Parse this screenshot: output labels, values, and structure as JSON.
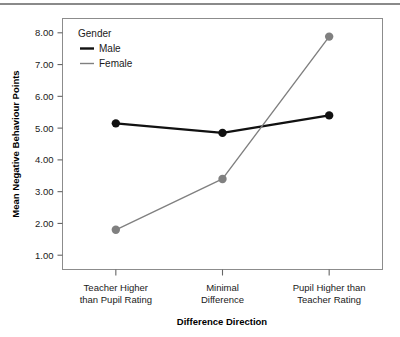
{
  "chart_data": {
    "type": "line",
    "title": "",
    "xlabel": "Difference Direction",
    "ylabel": "Mean Negative Behaviour Points",
    "categories": [
      "Teacher Higher\nthan Pupil Rating",
      "Minimal\nDifference",
      "Pupil Higher than\nTeacher Rating"
    ],
    "category_lines": [
      [
        "Teacher Higher",
        "than Pupil Rating"
      ],
      [
        "Minimal",
        "Difference"
      ],
      [
        "Pupil Higher than",
        "Teacher Rating"
      ]
    ],
    "series": [
      {
        "name": "Male",
        "values": [
          5.15,
          4.85,
          5.4
        ],
        "color": "#111111"
      },
      {
        "name": "Female",
        "values": [
          1.8,
          3.4,
          7.88
        ],
        "color": "#808080"
      }
    ],
    "legend": {
      "title": "Gender",
      "position": "top-left-inside",
      "entries": [
        "Male",
        "Female"
      ]
    },
    "ylim": [
      0.55,
      8.45
    ],
    "yticks": [
      1.0,
      2.0,
      3.0,
      4.0,
      5.0,
      6.0,
      7.0,
      8.0
    ],
    "ytick_labels": [
      "1.00",
      "2.00",
      "3.00",
      "4.00",
      "5.00",
      "6.00",
      "7.00",
      "8.00"
    ],
    "grid": false,
    "marker": "circle",
    "marker_size": 6
  },
  "axis_titles": {
    "x": "Difference Direction",
    "y": "Mean Negative Behaviour Points"
  },
  "colors": {
    "male": "#111111",
    "female": "#808080",
    "frame": "#8c8c8c",
    "axis": "#666666",
    "rule": "#8a8a8a"
  }
}
